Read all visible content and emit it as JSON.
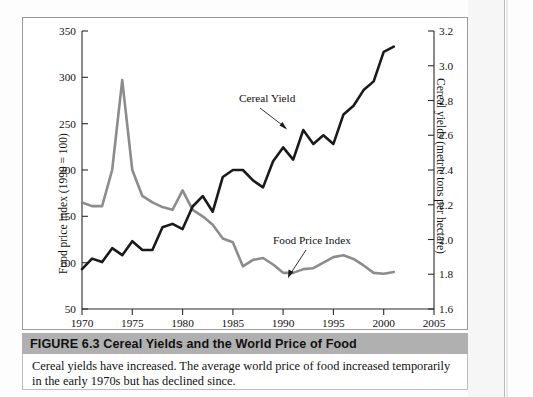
{
  "figure": {
    "number_label": "FIGURE 6.3",
    "title": "Cereal Yields and the World Price of Food",
    "title_full": "FIGURE 6.3  Cereal Yields and the World Price of Food",
    "caption": "Cereal yields have increased. The average world price of food increased temporarily in the early 1970s but has declined since."
  },
  "chart_data": {
    "type": "line",
    "title": "Cereal Yields and the World Price of Food",
    "xlabel": "",
    "ylabel": "Food price index (1990 = 100)",
    "y2label": "Cereal yields (metric tons per hectare)",
    "xlim": [
      1970,
      2005
    ],
    "ylim": [
      50,
      350
    ],
    "y2lim": [
      1.6,
      3.2
    ],
    "xticks": [
      1970,
      1975,
      1980,
      1985,
      1990,
      1995,
      2000,
      2005
    ],
    "yticks": [
      50,
      100,
      150,
      200,
      250,
      300,
      350
    ],
    "y2ticks": [
      1.6,
      1.8,
      2.0,
      2.2,
      2.4,
      2.6,
      2.8,
      3.0,
      3.2
    ],
    "grid": false,
    "legend_position": "in-plot annotations",
    "annotations": [
      {
        "text": "Cereal Yield",
        "series": "cereal_yield"
      },
      {
        "text": "Food Price Index",
        "series": "food_price_index"
      }
    ],
    "colors": {
      "cereal_yield": "#1a1a1a",
      "food_price_index": "#8c8c8c"
    },
    "x": [
      1970,
      1971,
      1972,
      1973,
      1974,
      1975,
      1976,
      1977,
      1978,
      1979,
      1980,
      1981,
      1982,
      1983,
      1984,
      1985,
      1986,
      1987,
      1988,
      1989,
      1990,
      1991,
      1992,
      1993,
      1994,
      1995,
      1996,
      1997,
      1998,
      1999,
      2000,
      2001
    ],
    "series": [
      {
        "name": "Food Price Index",
        "axis": "left",
        "color": "#8c8c8c",
        "values": [
          165,
          161,
          161,
          200,
          297,
          200,
          172,
          165,
          160,
          157,
          178,
          157,
          150,
          141,
          126,
          122,
          96,
          103,
          105,
          98,
          89,
          89,
          93,
          94,
          100,
          106,
          108,
          104,
          97,
          89,
          88,
          90
        ]
      },
      {
        "name": "Cereal Yield",
        "axis": "right",
        "color": "#1a1a1a",
        "values": [
          1.83,
          1.89,
          1.87,
          1.95,
          1.91,
          1.99,
          1.94,
          1.94,
          2.07,
          2.09,
          2.06,
          2.19,
          2.25,
          2.16,
          2.36,
          2.4,
          2.4,
          2.34,
          2.3,
          2.45,
          2.53,
          2.46,
          2.63,
          2.55,
          2.6,
          2.55,
          2.72,
          2.77,
          2.86,
          2.91,
          3.08,
          3.11
        ]
      }
    ]
  },
  "axis_text": {
    "y_left": [
      "350",
      "300",
      "250",
      "200",
      "150",
      "100",
      "50"
    ],
    "y_right": [
      "3.2",
      "3.0",
      "2.8",
      "2.6",
      "2.4",
      "2.2",
      "2.0",
      "1.8",
      "1.6"
    ],
    "x": [
      "1970",
      "1975",
      "1980",
      "1985",
      "1990",
      "1995",
      "2000",
      "2005"
    ],
    "y_left_title": "Food price index (1990 = 100)",
    "y_right_title": "Cereal yields (metric tons per hectare)"
  },
  "labels": {
    "cereal_yield": "Cereal Yield",
    "food_price_index": "Food Price Index"
  }
}
